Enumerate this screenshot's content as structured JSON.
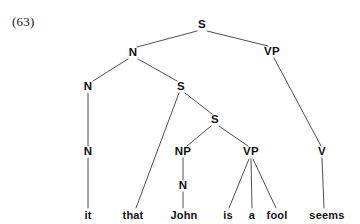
{
  "figure": {
    "example_number": "(63)",
    "sentence": "it that John is a fool seems",
    "ink_color": "#3a3a3a",
    "text_color": "#111111",
    "background_color": "#ffffff"
  },
  "nodes": {
    "root_s": {
      "label": "S",
      "x": 202,
      "y": 25
    },
    "n_upper": {
      "label": "N",
      "x": 133,
      "y": 53
    },
    "vp_matrix": {
      "label": "VP",
      "x": 272,
      "y": 52
    },
    "n_mid": {
      "label": "N",
      "x": 88,
      "y": 87
    },
    "s_embedded": {
      "label": "S",
      "x": 181,
      "y": 87
    },
    "n_lower": {
      "label": "N",
      "x": 88,
      "y": 152
    },
    "s_inner": {
      "label": "S",
      "x": 215,
      "y": 120
    },
    "np_subject": {
      "label": "NP",
      "x": 183,
      "y": 152
    },
    "vp_embedded": {
      "label": "VP",
      "x": 251,
      "y": 152
    },
    "v_matrix": {
      "label": "V",
      "x": 322,
      "y": 152
    },
    "n_john": {
      "label": "N",
      "x": 183,
      "y": 186
    }
  },
  "leaves": [
    {
      "word": "it",
      "x": 88,
      "y": 215
    },
    {
      "word": "that",
      "x": 133,
      "y": 215
    },
    {
      "word": "John",
      "x": 184,
      "y": 215
    },
    {
      "word": "is",
      "x": 228,
      "y": 215
    },
    {
      "word": "a",
      "x": 252,
      "y": 215
    },
    {
      "word": "fool",
      "x": 277,
      "y": 215
    },
    {
      "word": "seems",
      "x": 327,
      "y": 215
    }
  ],
  "edges": [
    {
      "from": "root_s",
      "to": "n_upper",
      "x1": 197,
      "y1": 31,
      "x2": 137,
      "y2": 47
    },
    {
      "from": "root_s",
      "to": "vp_matrix",
      "x1": 207,
      "y1": 31,
      "x2": 268,
      "y2": 46
    },
    {
      "from": "n_upper",
      "to": "n_mid",
      "x1": 128,
      "y1": 59,
      "x2": 93,
      "y2": 81
    },
    {
      "from": "n_upper",
      "to": "s_embedded",
      "x1": 138,
      "y1": 59,
      "x2": 177,
      "y2": 81
    },
    {
      "from": "n_mid",
      "to": "n_lower",
      "x1": 88,
      "y1": 93,
      "x2": 88,
      "y2": 146
    },
    {
      "from": "n_lower",
      "to": "it",
      "x1": 88,
      "y1": 158,
      "x2": 88,
      "y2": 208
    },
    {
      "from": "s_embedded",
      "to": "that",
      "x1": 179,
      "y1": 93,
      "x2": 136,
      "y2": 208
    },
    {
      "from": "s_embedded",
      "to": "s_inner",
      "x1": 185,
      "y1": 93,
      "x2": 212,
      "y2": 114
    },
    {
      "from": "s_inner",
      "to": "np_subject",
      "x1": 211,
      "y1": 126,
      "x2": 187,
      "y2": 146
    },
    {
      "from": "s_inner",
      "to": "vp_embedded",
      "x1": 219,
      "y1": 126,
      "x2": 248,
      "y2": 146
    },
    {
      "from": "np_subject",
      "to": "n_john",
      "x1": 183,
      "y1": 158,
      "x2": 183,
      "y2": 180
    },
    {
      "from": "n_john",
      "to": "John",
      "x1": 183,
      "y1": 192,
      "x2": 183,
      "y2": 208
    },
    {
      "from": "vp_embedded",
      "to": "is",
      "x1": 249,
      "y1": 159,
      "x2": 229,
      "y2": 208
    },
    {
      "from": "vp_embedded",
      "to": "a",
      "x1": 251,
      "y1": 159,
      "x2": 252,
      "y2": 208
    },
    {
      "from": "vp_embedded",
      "to": "fool",
      "x1": 253,
      "y1": 159,
      "x2": 276,
      "y2": 208
    },
    {
      "from": "vp_matrix",
      "to": "v_matrix",
      "x1": 274,
      "y1": 58,
      "x2": 321,
      "y2": 146
    },
    {
      "from": "v_matrix",
      "to": "seems",
      "x1": 322,
      "y1": 158,
      "x2": 324,
      "y2": 208
    }
  ]
}
